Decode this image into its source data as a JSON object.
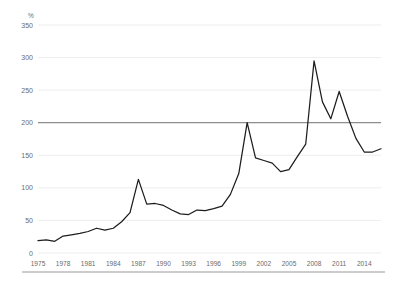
{
  "chart_data": {
    "type": "line",
    "title": "",
    "subtitle": "",
    "xlabel": "",
    "ylabel": "",
    "unit_label": "%",
    "grid": true,
    "legend": "none",
    "xlim": [
      1975,
      2016
    ],
    "ylim": [
      0,
      350
    ],
    "yticks": [
      0,
      50,
      100,
      150,
      200,
      250,
      300,
      350
    ],
    "ytick_labels": [
      "0",
      "50",
      "100",
      "150",
      "200",
      "250",
      "300",
      "350"
    ],
    "xticks": [
      1975,
      1978,
      1981,
      1984,
      1987,
      1990,
      1993,
      1996,
      1999,
      2002,
      2005,
      2008,
      2011,
      2014
    ],
    "xtick_labels": [
      "1975",
      "1978",
      "1981",
      "1984",
      "1987",
      "1990",
      "1993",
      "1996",
      "1999",
      "2002",
      "2005",
      "2008",
      "2011",
      "2014"
    ],
    "reference_line": {
      "value": 200,
      "color": "#8d8d8d"
    },
    "series": [
      {
        "name": "",
        "color": "#1d1d1d",
        "x": [
          1975,
          1976,
          1977,
          1978,
          1979,
          1980,
          1981,
          1982,
          1983,
          1984,
          1985,
          1986,
          1987,
          1988,
          1989,
          1990,
          1991,
          1992,
          1993,
          1994,
          1995,
          1996,
          1997,
          1998,
          1999,
          2000,
          2001,
          2002,
          2003,
          2004,
          2005,
          2006,
          2007,
          2008,
          2009,
          2010,
          2011,
          2012,
          2013,
          2014,
          2015,
          2016
        ],
        "values": [
          19,
          20,
          18,
          26,
          28,
          30,
          33,
          38,
          35,
          38,
          48,
          62,
          113,
          75,
          76,
          73,
          66,
          60,
          59,
          66,
          65,
          68,
          72,
          90,
          122,
          200,
          146,
          142,
          138,
          125,
          128,
          148,
          167,
          295,
          232,
          206,
          248,
          210,
          176,
          155,
          155,
          160
        ]
      }
    ]
  }
}
